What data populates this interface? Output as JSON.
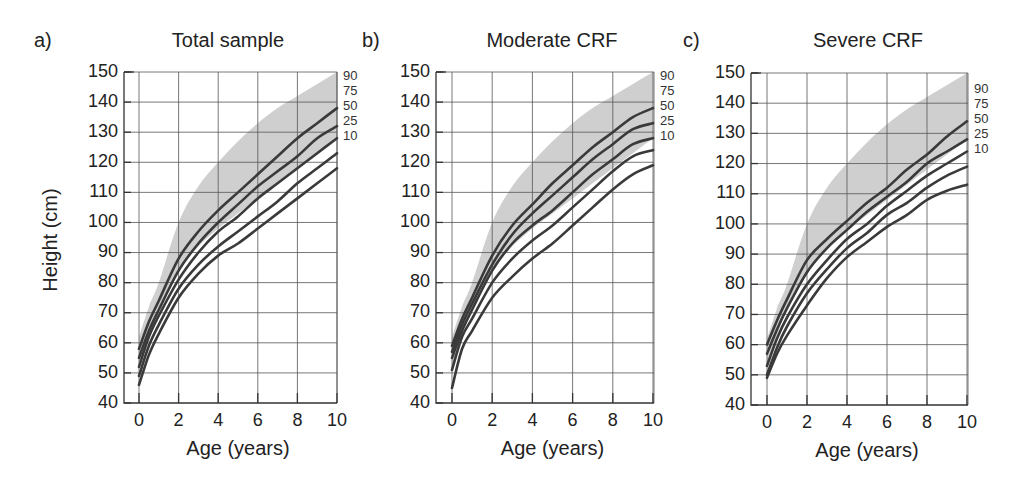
{
  "figure": {
    "ylabel": "Height (cm)",
    "xlabel": "Age (years)"
  },
  "panels": [
    {
      "letter": "a)",
      "title": "Total sample"
    },
    {
      "letter": "b)",
      "title": "Moderate CRF"
    },
    {
      "letter": "c)",
      "title": "Severe CRF"
    }
  ],
  "colors": {
    "curve": "#3a3a3a",
    "band": "#cfcfcf",
    "grid": "#555555"
  },
  "chart_data": [
    {
      "type": "line",
      "title": "Total sample",
      "panel_label": "a)",
      "xlabel": "Age (years)",
      "ylabel": "Height (cm)",
      "xlim": [
        0,
        10
      ],
      "ylim": [
        40,
        150
      ],
      "xticks": [
        0,
        2,
        4,
        6,
        8,
        10
      ],
      "yticks": [
        40,
        50,
        60,
        70,
        80,
        90,
        100,
        110,
        120,
        130,
        140,
        150
      ],
      "grid": true,
      "x": [
        0,
        0.5,
        1,
        2,
        3,
        4,
        5,
        6,
        7,
        8,
        9,
        10
      ],
      "series": [
        {
          "name": "90",
          "values": [
            58,
            67,
            74,
            88,
            97,
            104,
            110,
            116,
            122,
            128,
            133,
            138
          ]
        },
        {
          "name": "75",
          "values": [
            55,
            64,
            71,
            84,
            93,
            100,
            106,
            112,
            117,
            122,
            128,
            132
          ]
        },
        {
          "name": "50",
          "values": [
            52,
            62,
            69,
            81,
            90,
            97,
            102,
            108,
            113,
            118,
            123,
            128
          ]
        },
        {
          "name": "25",
          "values": [
            49,
            59,
            66,
            78,
            86,
            92,
            97,
            102,
            107,
            113,
            118,
            123
          ]
        },
        {
          "name": "10",
          "values": [
            46,
            56,
            63,
            75,
            83,
            89,
            93,
            98,
            103,
            108,
            113,
            118
          ]
        }
      ],
      "reference_band": {
        "upper": [
          62,
          72,
          80,
          100,
          112,
          120,
          127,
          133,
          138,
          142,
          146,
          150
        ],
        "lower": [
          52,
          63,
          72,
          84,
          92,
          98,
          103,
          108,
          113,
          118,
          123,
          128
        ]
      },
      "series_labels_position": "right-end"
    },
    {
      "type": "line",
      "title": "Moderate CRF",
      "panel_label": "b)",
      "xlabel": "Age (years)",
      "ylabel": "",
      "xlim": [
        0,
        10
      ],
      "ylim": [
        40,
        150
      ],
      "xticks": [
        0,
        2,
        4,
        6,
        8,
        10
      ],
      "yticks": [
        40,
        50,
        60,
        70,
        80,
        90,
        100,
        110,
        120,
        130,
        140,
        150
      ],
      "grid": true,
      "x": [
        0,
        0.5,
        1,
        2,
        3,
        4,
        5,
        6,
        7,
        8,
        9,
        10
      ],
      "series": [
        {
          "name": "90",
          "values": [
            59,
            68,
            75,
            89,
            99,
            106,
            113,
            119,
            125,
            130,
            135,
            138
          ]
        },
        {
          "name": "75",
          "values": [
            57,
            66,
            73,
            86,
            96,
            103,
            109,
            115,
            121,
            126,
            131,
            133
          ]
        },
        {
          "name": "50",
          "values": [
            55,
            64,
            71,
            84,
            93,
            99,
            104,
            110,
            116,
            121,
            126,
            128
          ]
        },
        {
          "name": "25",
          "values": [
            51,
            62,
            68,
            80,
            88,
            94,
            99,
            105,
            111,
            117,
            122,
            124
          ]
        },
        {
          "name": "10",
          "values": [
            45,
            58,
            64,
            75,
            82,
            88,
            93,
            99,
            105,
            111,
            116,
            119
          ]
        }
      ],
      "reference_band": {
        "upper": [
          62,
          72,
          80,
          100,
          112,
          120,
          127,
          133,
          138,
          142,
          146,
          150
        ],
        "lower": [
          52,
          63,
          72,
          84,
          92,
          98,
          103,
          108,
          113,
          118,
          123,
          128
        ]
      },
      "series_labels_position": "right-end"
    },
    {
      "type": "line",
      "title": "Severe CRF",
      "panel_label": "c)",
      "xlabel": "Age (years)",
      "ylabel": "",
      "xlim": [
        0,
        10
      ],
      "ylim": [
        40,
        150
      ],
      "xticks": [
        0,
        2,
        4,
        6,
        8,
        10
      ],
      "yticks": [
        40,
        50,
        60,
        70,
        80,
        90,
        100,
        110,
        120,
        130,
        140,
        150
      ],
      "grid": true,
      "x": [
        0,
        0.5,
        1,
        2,
        3,
        4,
        5,
        6,
        7,
        8,
        9,
        10
      ],
      "series": [
        {
          "name": "90",
          "values": [
            60,
            68,
            75,
            88,
            95,
            101,
            107,
            112,
            118,
            123,
            129,
            134
          ]
        },
        {
          "name": "75",
          "values": [
            57,
            65,
            72,
            84,
            92,
            98,
            104,
            109,
            114,
            120,
            124,
            128
          ]
        },
        {
          "name": "50",
          "values": [
            53,
            62,
            69,
            80,
            88,
            95,
            100,
            106,
            111,
            116,
            120,
            124
          ]
        },
        {
          "name": "25",
          "values": [
            50,
            59,
            66,
            77,
            85,
            92,
            97,
            103,
            107,
            112,
            116,
            119
          ]
        },
        {
          "name": "10",
          "values": [
            49,
            57,
            63,
            73,
            82,
            89,
            94,
            99,
            103,
            108,
            111,
            113
          ]
        }
      ],
      "reference_band": {
        "upper": [
          62,
          72,
          80,
          100,
          112,
          120,
          127,
          133,
          138,
          142,
          146,
          150
        ],
        "lower": [
          52,
          63,
          72,
          84,
          92,
          98,
          103,
          108,
          113,
          118,
          123,
          128
        ]
      },
      "series_labels_position": "right-end"
    }
  ]
}
